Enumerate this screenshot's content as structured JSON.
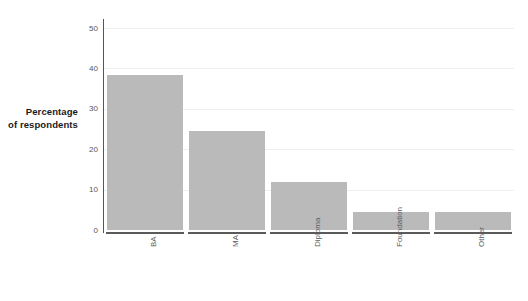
{
  "chart_data": {
    "type": "bar",
    "title": "",
    "subtitle": "",
    "xlabel": "",
    "ylabel": "Percentage of respondents",
    "ylabel_lines": [
      "Percentage",
      "of respondents"
    ],
    "categories": [
      "BA",
      "MA",
      "Diploma",
      "Foundation",
      "Other"
    ],
    "values": [
      38.5,
      24.5,
      12.0,
      4.5,
      4.5
    ],
    "ylim": [
      0,
      52
    ],
    "yticks": [
      0,
      10,
      20,
      30,
      40,
      50
    ],
    "ytick_labels": [
      "0",
      "10",
      "20",
      "30",
      "40",
      "50"
    ],
    "grid": true,
    "grid_axis": "y",
    "legend": false,
    "legend_position": "none",
    "bar_color": "#bababa",
    "gridline_color": "#efefef",
    "axis_color": "#555555",
    "tick_label_color": "#555555",
    "category_label_color": "#5c5c5c",
    "background_color": "#ffffff"
  },
  "axis": {
    "y_label_line1": "Percentage",
    "y_label_line2": "of respondents"
  }
}
